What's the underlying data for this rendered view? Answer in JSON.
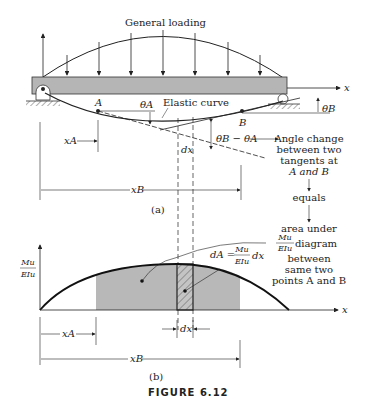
{
  "figure": {
    "caption": "FIGURE 6.12",
    "part_a": {
      "label": "(a)",
      "loading_label": "General loading",
      "curve_label": "Elastic curve",
      "x_axis": "x",
      "point_a": "A",
      "point_b": "B",
      "theta_a": "θA",
      "theta_b": "θB",
      "theta_diff": "θB − θA",
      "dx": "dx",
      "x_a": "xA",
      "x_b": "xB"
    },
    "part_b": {
      "label": "(b)",
      "y_axis_num": "Mu",
      "y_axis_den": "EIu",
      "x_axis": "x",
      "dA_lhs": "dA =",
      "dA_num": "Mu",
      "dA_den": "EIu",
      "dA_rhs": "dx",
      "dx": "dx",
      "x_a": "xA",
      "x_b": "xB"
    },
    "explanation": {
      "line1": "Angle change",
      "line2": "between two",
      "line3": "tangents at",
      "line4": "A and B",
      "equals": "equals",
      "line5": "area under",
      "frac_num": "Mu",
      "frac_den": "EIu",
      "line6": "diagram",
      "line7": "between",
      "line8": "same two",
      "line9": "points A and B"
    },
    "colors": {
      "beam": "#b5b5b5",
      "shaded_area": "#b8b8b8",
      "line": "#222222"
    }
  }
}
